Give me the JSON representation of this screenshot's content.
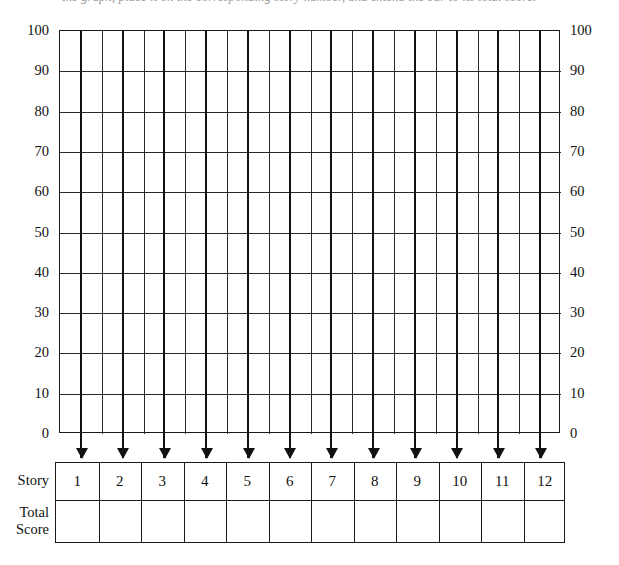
{
  "caption": {
    "text": "the graph, place it on the corresponding story number, and extend the bar to its total score."
  },
  "chart_data": {
    "type": "bar",
    "title": "",
    "subtitle": "",
    "xlabel": "Story",
    "ylabel": "",
    "categories": [
      "1",
      "2",
      "3",
      "4",
      "5",
      "6",
      "7",
      "8",
      "9",
      "10",
      "11",
      "12"
    ],
    "values": [
      null,
      null,
      null,
      null,
      null,
      null,
      null,
      null,
      null,
      null,
      null,
      null
    ],
    "ylim": [
      0,
      100
    ],
    "y_ticks": [
      100,
      90,
      80,
      70,
      60,
      50,
      40,
      30,
      20,
      10,
      0
    ],
    "y_ticks_right": [
      100,
      90,
      80,
      70,
      60,
      50,
      40,
      30,
      20,
      10,
      0
    ],
    "grid": true,
    "legend": "none"
  },
  "axes": {
    "left_labels": [
      "100",
      "90",
      "80",
      "70",
      "60",
      "50",
      "40",
      "30",
      "20",
      "10",
      "0"
    ],
    "right_labels": [
      "100",
      "90",
      "80",
      "70",
      "60",
      "50",
      "40",
      "30",
      "20",
      "10",
      "0"
    ]
  },
  "table": {
    "row_labels": {
      "story": "Story",
      "total_score_line1": "Total",
      "total_score_line2": "Score"
    },
    "story_numbers": [
      "1",
      "2",
      "3",
      "4",
      "5",
      "6",
      "7",
      "8",
      "9",
      "10",
      "11",
      "12"
    ],
    "total_scores": [
      "",
      "",
      "",
      "",
      "",
      "",
      "",
      "",
      "",
      "",
      "",
      ""
    ]
  },
  "colors": {
    "background": "#ffffff",
    "line": "#1a1a1a",
    "grid_line": "#2a2a2a",
    "text": "#111111"
  }
}
